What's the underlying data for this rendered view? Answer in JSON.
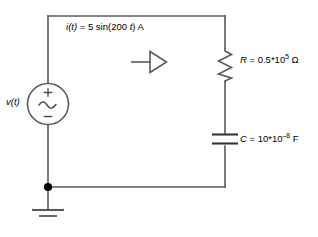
{
  "figure": {
    "background_color": "#ffffff",
    "wire_color": "#595959",
    "text_color": "#000000"
  },
  "labels": {
    "current": {
      "name": "i",
      "prefix": "i",
      "arg": "(t)",
      "equals": " = 5 sin(200 ",
      "var": "t",
      "suffix": ") A",
      "full_text": "i(t) = 5 sin(200 t) A"
    },
    "source": {
      "prefix": "v",
      "arg": "(t)",
      "full_text": "v(t)"
    },
    "resistor": {
      "symbol": "R",
      "equals": " = 0.5*10",
      "exponent": "5",
      "unit": " Ω",
      "full_text": "R = 0.5*10^5 Ω"
    },
    "capacitor": {
      "symbol": "C",
      "equals": " = 10*10",
      "exponent": "–8",
      "unit": " F",
      "full_text": "C = 10*10^-8 F"
    }
  },
  "components": {
    "source": {
      "type": "ac-voltage-source",
      "plus_sign": "+",
      "minus_sign": "–",
      "waveform": "sine"
    },
    "resistor": {
      "type": "zigzag-resistor"
    },
    "capacitor": {
      "type": "parallel-plate-capacitor"
    },
    "ground": {
      "type": "earth-ground"
    },
    "junction": {
      "type": "node-dot"
    },
    "current_arrow": {
      "type": "open-arrow",
      "direction": "right"
    }
  }
}
